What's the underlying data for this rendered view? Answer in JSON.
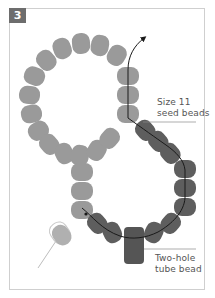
{
  "figure": {
    "step_number": "3",
    "labels": {
      "seed_beads": [
        "Size 11",
        "seed beads"
      ],
      "tube_bead": [
        "Two-hole",
        "tube bead"
      ]
    },
    "colors": {
      "light_bead": "#9a9a9a",
      "dark_bead": "#5e5e5e",
      "tube_bead": "#555555",
      "badge_bg": "#6d6d6d",
      "thread": "#1a1a1a",
      "frame": "#cfcfcf",
      "leader_line": "#8a8a8a"
    }
  }
}
